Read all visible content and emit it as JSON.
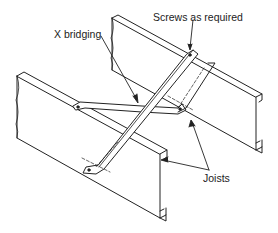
{
  "diagram": {
    "labels": {
      "screws": "Screws as required",
      "x_bridging": "X bridging",
      "joists": "Joists"
    },
    "components": [
      "joist-front",
      "joist-back",
      "bridging-strap-1",
      "bridging-strap-2",
      "screw-points"
    ],
    "colors": {
      "line": "#222222",
      "background": "#ffffff"
    }
  }
}
